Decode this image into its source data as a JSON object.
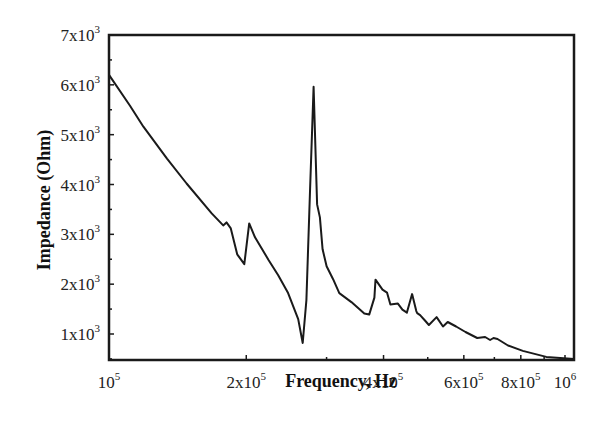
{
  "chart_data": {
    "type": "line",
    "title": "",
    "xlabel": "Frequency, Hz",
    "ylabel": "Impedance (Ohm)",
    "xscale": "log",
    "xlim": [
      100000,
      1100000
    ],
    "ylim": [
      500,
      7000
    ],
    "grid": false,
    "legend": null,
    "x_ticks": [
      {
        "value": 100000,
        "label": "10",
        "exp": "5"
      },
      {
        "value": 200000,
        "label": "2x10",
        "exp": "5"
      },
      {
        "value": 400000,
        "label": "4x10",
        "exp": "5"
      },
      {
        "value": 600000,
        "label": "6x10",
        "exp": "5"
      },
      {
        "value": 800000,
        "label": "8x10",
        "exp": "5"
      },
      {
        "value": 1000000,
        "label": "10",
        "exp": "6"
      }
    ],
    "x_minor_ticks": [
      300000,
      500000,
      700000,
      900000
    ],
    "y_ticks": [
      {
        "value": 1000,
        "label": "1x10",
        "exp": "3"
      },
      {
        "value": 2000,
        "label": "2x10",
        "exp": "3"
      },
      {
        "value": 3000,
        "label": "3x10",
        "exp": "3"
      },
      {
        "value": 4000,
        "label": "4x10",
        "exp": "3"
      },
      {
        "value": 5000,
        "label": "5x10",
        "exp": "3"
      },
      {
        "value": 6000,
        "label": "6x10",
        "exp": "3"
      },
      {
        "value": 7000,
        "label": "7x10",
        "exp": "3"
      }
    ],
    "series": [
      {
        "name": "Impedance",
        "color": "#1a1a1a",
        "x": [
          100000,
          111200,
          119000,
          134000,
          148000,
          168000,
          178000,
          181000,
          185000,
          191000,
          198000,
          203000,
          209000,
          224000,
          235000,
          247000,
          260000,
          266000,
          271000,
          276000,
          281000,
          286000,
          290000,
          294000,
          300000,
          310000,
          320000,
          340000,
          363000,
          372000,
          382000,
          384000,
          398000,
          407000,
          414000,
          430000,
          440000,
          450000,
          462000,
          472000,
          474000,
          481000,
          492000,
          503000,
          523000,
          540000,
          553000,
          577000,
          605000,
          642000,
          668000,
          685000,
          697000,
          711000,
          750000,
          808000,
          910000,
          1100000
        ],
        "y": [
          6200,
          5580,
          5160,
          4520,
          4020,
          3420,
          3180,
          3240,
          3120,
          2600,
          2400,
          3220,
          2940,
          2480,
          2180,
          1820,
          1300,
          820,
          1680,
          3920,
          5960,
          3600,
          3340,
          2700,
          2360,
          2100,
          1820,
          1640,
          1410,
          1390,
          1730,
          2090,
          1890,
          1830,
          1590,
          1610,
          1490,
          1430,
          1800,
          1460,
          1420,
          1380,
          1280,
          1180,
          1340,
          1150,
          1240,
          1150,
          1040,
          920,
          940,
          880,
          920,
          900,
          770,
          660,
          540,
          500
        ]
      }
    ]
  }
}
